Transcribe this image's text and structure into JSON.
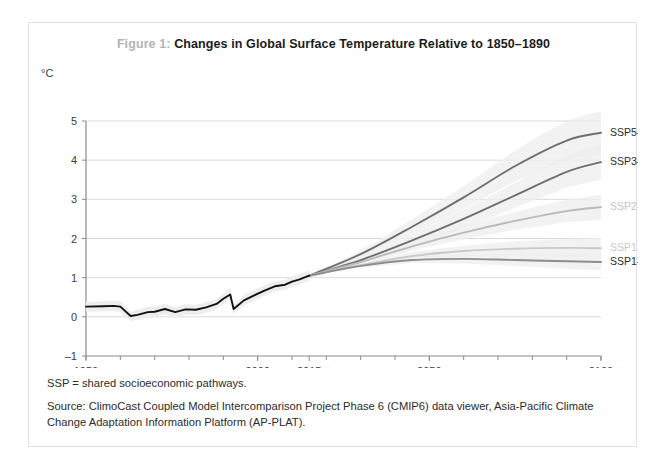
{
  "figure": {
    "number_label": "Figure 1:",
    "title": "Changes in Global Surface Temperature Relative to 1850–1890",
    "unit_label": "°C",
    "notes": [
      "SSP = shared socioeconomic pathways.",
      "Source: ClimoCast Coupled Model Intercomparison Project Phase 6 (CMIP6) data viewer, Asia-Pacific Climate Change Adaptation Information Platform (AP-PLAT)."
    ]
  },
  "colors": {
    "historical_line": "#111111",
    "line_dark": "#6f6f6f",
    "line_mid": "#9a9a9a",
    "line_light": "#c2c2c2",
    "band": "#ededed",
    "gridline": "#d9d9d9",
    "axis": "#8a8a8a",
    "label_dark": "#2b2b2b",
    "label_light": "#bdbdbd",
    "fignum": "#b4b4b4",
    "border": "#e2e2e2"
  },
  "chart_data": {
    "type": "line",
    "title": "Changes in Global Surface Temperature Relative to 1850–1890",
    "xlabel": "",
    "ylabel": "°C",
    "xlim": [
      1950,
      2100
    ],
    "ylim": [
      -1,
      5
    ],
    "yticks": [
      5,
      4,
      3,
      2,
      1,
      0,
      -1
    ],
    "xticks_labeled": [
      1950,
      2000,
      2015,
      2050,
      2100
    ],
    "xtick_minor_step": 10,
    "grid": "horizontal",
    "legend": "inline-right-of-line-ends",
    "historical": {
      "name": "Historical (observed)",
      "color": "#111111",
      "x": [
        1950,
        1955,
        1958,
        1960,
        1963,
        1965,
        1968,
        1970,
        1973,
        1976,
        1979,
        1982,
        1985,
        1988,
        1990,
        1992,
        1993,
        1996,
        1999,
        2002,
        2005,
        2008,
        2010,
        2012,
        2015
      ],
      "y": [
        0.26,
        0.27,
        0.28,
        0.26,
        0.02,
        0.05,
        0.12,
        0.13,
        0.2,
        0.12,
        0.19,
        0.18,
        0.24,
        0.33,
        0.46,
        0.57,
        0.2,
        0.42,
        0.55,
        0.67,
        0.78,
        0.82,
        0.9,
        0.95,
        1.05
      ]
    },
    "series": [
      {
        "name": "SSP5-8.5",
        "label": "SSP5-8.5",
        "color": "#6f6f6f",
        "label_color": "#2b2b2b",
        "x": [
          2015,
          2030,
          2045,
          2060,
          2075,
          2090,
          2100
        ],
        "y": [
          1.05,
          1.6,
          2.3,
          3.05,
          3.85,
          4.5,
          4.7
        ],
        "end_value": 4.7
      },
      {
        "name": "SSP3-7.0",
        "label": "SSP3-7.0",
        "color": "#6f6f6f",
        "label_color": "#2b2b2b",
        "x": [
          2015,
          2030,
          2045,
          2060,
          2075,
          2090,
          2100
        ],
        "y": [
          1.05,
          1.45,
          1.95,
          2.5,
          3.1,
          3.7,
          3.95
        ],
        "end_value": 3.95
      },
      {
        "name": "SSP2-4.5",
        "label": "SSP2-4.5",
        "color": "#b9b9b9",
        "label_color": "#c4c4c4",
        "x": [
          2015,
          2030,
          2045,
          2060,
          2075,
          2090,
          2100
        ],
        "y": [
          1.05,
          1.4,
          1.8,
          2.15,
          2.45,
          2.7,
          2.8
        ],
        "end_value": 2.8
      },
      {
        "name": "SSP1-2.6",
        "label": "SSP1-2.6",
        "color": "#c9c9c9",
        "label_color": "#c9c9c9",
        "x": [
          2015,
          2030,
          2045,
          2060,
          2075,
          2090,
          2100
        ],
        "y": [
          1.05,
          1.32,
          1.55,
          1.68,
          1.74,
          1.76,
          1.75
        ],
        "end_value": 1.75
      },
      {
        "name": "SSP1-1.9",
        "label": "SSP1-1.9",
        "color": "#8d8d8d",
        "label_color": "#2b2b2b",
        "x": [
          2015,
          2030,
          2045,
          2060,
          2075,
          2090,
          2100
        ],
        "y": [
          1.05,
          1.3,
          1.45,
          1.48,
          1.45,
          1.42,
          1.4
        ],
        "end_value": 1.4
      }
    ]
  }
}
